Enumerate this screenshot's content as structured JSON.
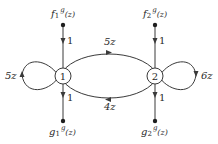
{
  "diagram": {
    "type": "signal-flow-graph",
    "nodes": [
      {
        "id": "1",
        "label": "1"
      },
      {
        "id": "2",
        "label": "2"
      }
    ],
    "sources": [
      {
        "id": "f1",
        "label_base": "f",
        "label_sub": "1",
        "label_sup": "g",
        "label_tail": "(z)",
        "edge_gain": "1",
        "target": "1"
      },
      {
        "id": "f2",
        "label_base": "f",
        "label_sub": "2",
        "label_sup": "g",
        "label_tail": "(z)",
        "edge_gain": "1",
        "target": "2"
      }
    ],
    "sinks": [
      {
        "id": "g1",
        "label_base": "g",
        "label_sub": "1",
        "label_sup": "g",
        "label_tail": "(z)",
        "edge_gain": "1",
        "source": "1"
      },
      {
        "id": "g2",
        "label_base": "g",
        "label_sub": "2",
        "label_sup": "g",
        "label_tail": "(z)",
        "edge_gain": "1",
        "source": "2"
      }
    ],
    "edges": [
      {
        "from": "1",
        "to": "2",
        "gain": "5z"
      },
      {
        "from": "2",
        "to": "1",
        "gain": "4z"
      },
      {
        "from": "1",
        "to": "1",
        "gain": "5z"
      },
      {
        "from": "2",
        "to": "2",
        "gain": "6z"
      }
    ]
  }
}
